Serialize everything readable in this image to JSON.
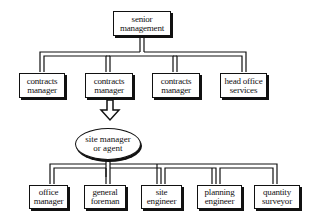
{
  "diagram": {
    "type": "organization-chart",
    "top": {
      "label_line1": "senior",
      "label_line2": "management"
    },
    "level2": [
      {
        "label_line1": "contracts",
        "label_line2": "manager"
      },
      {
        "label_line1": "contracts",
        "label_line2": "manager"
      },
      {
        "label_line1": "contracts",
        "label_line2": "manager"
      },
      {
        "label_line1": "head office",
        "label_line2": "services"
      }
    ],
    "site": {
      "label_line1": "site manager",
      "label_line2": "or agent"
    },
    "level4": [
      {
        "label_line1": "office",
        "label_line2": "manager"
      },
      {
        "label_line1": "general",
        "label_line2": "foreman"
      },
      {
        "label_line1": "site",
        "label_line2": "engineer"
      },
      {
        "label_line1": "planning",
        "label_line2": "engineer"
      },
      {
        "label_line1": "quantity",
        "label_line2": "surveyor"
      }
    ],
    "colors": {
      "line": "#111111",
      "fill": "#ffffff"
    }
  }
}
